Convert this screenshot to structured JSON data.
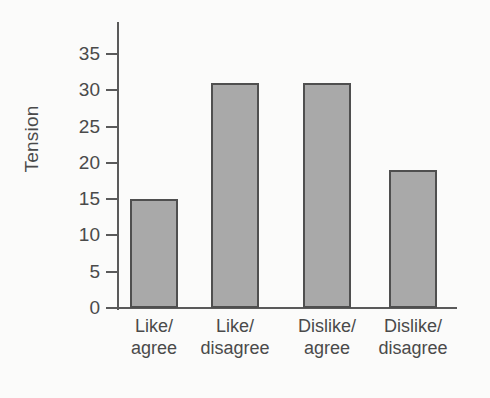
{
  "chart_data": {
    "type": "bar",
    "title": "",
    "subtitle": "",
    "xlabel": "",
    "ylabel": "Tension",
    "categories": [
      "Like/\nagree",
      "Like/\ndisagree",
      "Dislike/\nagree",
      "Dislike/\ndisagree"
    ],
    "category_lines": [
      [
        "Like/",
        "agree"
      ],
      [
        "Like/",
        "disagree"
      ],
      [
        "Dislike/",
        "agree"
      ],
      [
        "Dislike/",
        "disagree"
      ]
    ],
    "values": [
      15,
      31,
      31,
      19
    ],
    "ylim": [
      0,
      35
    ],
    "yticks": [
      0,
      5,
      10,
      15,
      20,
      25,
      30,
      35
    ],
    "ytick_labels": [
      "0",
      "5",
      "10",
      "15",
      "20",
      "25",
      "30",
      "35"
    ],
    "grid": false,
    "legend": null,
    "legend_position": "none",
    "annotations": [],
    "colors": {
      "bar_fill": "#a9a9a9",
      "bar_border": "#4f4f4f",
      "axis": "#5a5a5a",
      "text": "#4a4a4a",
      "background": "#fbfbfa"
    }
  }
}
